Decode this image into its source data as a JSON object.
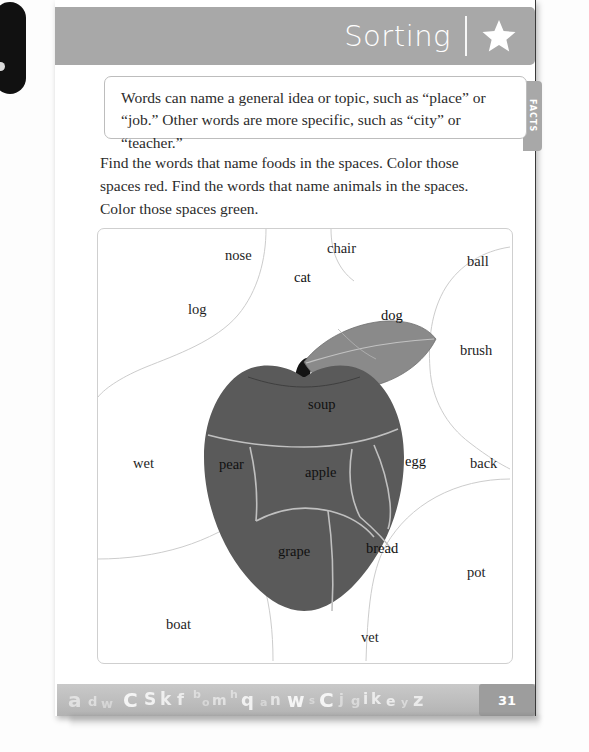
{
  "header": {
    "title": "Sorting",
    "star_icon": "star-icon",
    "bar_color": "#a8a8a8"
  },
  "facts": {
    "tab_label": "FACTS",
    "line1": "Words can name a general idea or topic, such as “place” or",
    "line2": "“job.” Other words are more specific, such as “city” or “teacher.”"
  },
  "instructions": {
    "line1": "Find the words that name foods in the spaces. Color those",
    "line2": "spaces red. Find the words that name animals in the spaces.",
    "line3": "Color those spaces green."
  },
  "puzzle": {
    "apple_color": "#5a5a5a",
    "leaf_color": "#8a8a8a",
    "stem_color": "#141414",
    "line_color": "#c8c8c8",
    "inside_words": [
      {
        "text": "cat",
        "x": 196,
        "y": 53,
        "region": "leaf"
      },
      {
        "text": "dog",
        "x": 283,
        "y": 91,
        "region": "leaf"
      },
      {
        "text": "soup",
        "x": 210,
        "y": 180,
        "region": "apple-top"
      },
      {
        "text": "pear",
        "x": 121,
        "y": 240,
        "region": "apple-left"
      },
      {
        "text": "apple",
        "x": 207,
        "y": 248,
        "region": "apple-center"
      },
      {
        "text": "egg",
        "x": 307,
        "y": 237,
        "region": "apple-right"
      },
      {
        "text": "grape",
        "x": 180,
        "y": 327,
        "region": "apple-bottom-left"
      },
      {
        "text": "bread",
        "x": 268,
        "y": 324,
        "region": "apple-bottom-right"
      }
    ],
    "outside_words": [
      {
        "text": "nose",
        "x": 127,
        "y": 31
      },
      {
        "text": "chair",
        "x": 229,
        "y": 24
      },
      {
        "text": "ball",
        "x": 369,
        "y": 37
      },
      {
        "text": "log",
        "x": 90,
        "y": 85
      },
      {
        "text": "brush",
        "x": 362,
        "y": 126
      },
      {
        "text": "wet",
        "x": 35,
        "y": 239
      },
      {
        "text": "back",
        "x": 372,
        "y": 239
      },
      {
        "text": "pot",
        "x": 369,
        "y": 348
      },
      {
        "text": "boat",
        "x": 68,
        "y": 400
      },
      {
        "text": "vet",
        "x": 263,
        "y": 413
      }
    ]
  },
  "footer": {
    "page_number": "31",
    "letters": [
      {
        "ch": "a",
        "x": 11,
        "y": 6,
        "size": 20,
        "opacity": 0.55
      },
      {
        "ch": "d",
        "x": 31,
        "y": 11,
        "size": 13,
        "opacity": 0.5
      },
      {
        "ch": "w",
        "x": 44,
        "y": 13,
        "size": 13,
        "opacity": 0.4
      },
      {
        "ch": "C",
        "x": 66,
        "y": 6,
        "size": 20,
        "opacity": 0.85
      },
      {
        "ch": "S",
        "x": 87,
        "y": 7,
        "size": 17,
        "opacity": 0.8
      },
      {
        "ch": "k",
        "x": 103,
        "y": 7,
        "size": 17,
        "opacity": 0.75
      },
      {
        "ch": "f",
        "x": 120,
        "y": 8,
        "size": 16,
        "opacity": 0.7
      },
      {
        "ch": "b",
        "x": 136,
        "y": 5,
        "size": 11,
        "opacity": 0.45
      },
      {
        "ch": "o",
        "x": 145,
        "y": 13,
        "size": 11,
        "opacity": 0.4
      },
      {
        "ch": "m",
        "x": 155,
        "y": 9,
        "size": 14,
        "opacity": 0.55
      },
      {
        "ch": "h",
        "x": 173,
        "y": 5,
        "size": 11,
        "opacity": 0.45
      },
      {
        "ch": "q",
        "x": 184,
        "y": 7,
        "size": 18,
        "opacity": 0.8
      },
      {
        "ch": "a",
        "x": 203,
        "y": 13,
        "size": 11,
        "opacity": 0.4
      },
      {
        "ch": "n",
        "x": 213,
        "y": 9,
        "size": 15,
        "opacity": 0.6
      },
      {
        "ch": "w",
        "x": 230,
        "y": 7,
        "size": 19,
        "opacity": 0.85
      },
      {
        "ch": "s",
        "x": 252,
        "y": 12,
        "size": 10,
        "opacity": 0.4
      },
      {
        "ch": "C",
        "x": 262,
        "y": 6,
        "size": 20,
        "opacity": 0.85
      },
      {
        "ch": "j",
        "x": 282,
        "y": 8,
        "size": 14,
        "opacity": 0.45
      },
      {
        "ch": "g",
        "x": 294,
        "y": 10,
        "size": 13,
        "opacity": 0.45
      },
      {
        "ch": "i",
        "x": 306,
        "y": 8,
        "size": 15,
        "opacity": 0.7
      },
      {
        "ch": "k",
        "x": 314,
        "y": 8,
        "size": 15,
        "opacity": 0.7
      },
      {
        "ch": "e",
        "x": 329,
        "y": 10,
        "size": 14,
        "opacity": 0.7
      },
      {
        "ch": "y",
        "x": 344,
        "y": 13,
        "size": 11,
        "opacity": 0.45
      },
      {
        "ch": "z",
        "x": 356,
        "y": 7,
        "size": 18,
        "opacity": 0.7
      }
    ]
  }
}
